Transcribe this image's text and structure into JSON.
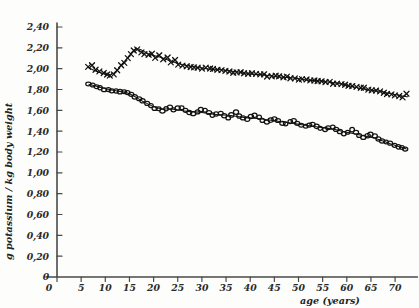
{
  "figure": {
    "background_color": "#fdfdfc",
    "ink_color": "#171717",
    "axis_color": "#4a4a48"
  },
  "axes": {
    "y_title": "g potassium / kg body weight",
    "x_title": "age (years)",
    "y_ticks": [
      "0",
      "0,20",
      "0,40",
      "0,60",
      "0,80",
      "1,00",
      "1,20",
      "1,40",
      "1,60",
      "1,80",
      "2,00",
      "2,20",
      "2,40"
    ],
    "x_ticks": [
      "0",
      "5",
      "10",
      "15",
      "20",
      "25",
      "30",
      "35",
      "40",
      "45",
      "50",
      "55",
      "60",
      "65",
      "70"
    ],
    "x_min": 0,
    "x_max": 74,
    "y_min": 0,
    "y_max": 2.4,
    "grid": false
  },
  "chart_data": {
    "type": "scatter",
    "title": "",
    "subtitle": "",
    "xlabel": "age (years)",
    "ylabel": "g potassium / kg body weight",
    "xlim": [
      0,
      74
    ],
    "ylim": [
      0,
      2.4
    ],
    "xticks": [
      0,
      5,
      10,
      15,
      20,
      25,
      30,
      35,
      40,
      45,
      50,
      55,
      60,
      65,
      70
    ],
    "yticks": [
      0,
      0.2,
      0.4,
      0.6,
      0.8,
      1.0,
      1.2,
      1.4,
      1.6,
      1.8,
      2.0,
      2.2,
      2.4
    ],
    "grid": false,
    "legend": "none",
    "decimal_separator": ",",
    "annotations": [],
    "series": [
      {
        "name": "upper series (x markers)",
        "marker": "x",
        "trend_line": true,
        "points": [
          [
            6.5,
            2.01
          ],
          [
            7.3,
            2.03
          ],
          [
            8.0,
            1.99
          ],
          [
            8.8,
            1.98
          ],
          [
            9.6,
            1.96
          ],
          [
            10.3,
            1.95
          ],
          [
            11.0,
            1.94
          ],
          [
            11.8,
            1.95
          ],
          [
            12.5,
            1.99
          ],
          [
            13.2,
            2.03
          ],
          [
            13.9,
            2.06
          ],
          [
            14.6,
            2.1
          ],
          [
            15.3,
            2.14
          ],
          [
            16.0,
            2.18
          ],
          [
            16.7,
            2.19
          ],
          [
            17.4,
            2.15
          ],
          [
            18.1,
            2.14
          ],
          [
            18.9,
            2.13
          ],
          [
            19.6,
            2.14
          ],
          [
            20.4,
            2.11
          ],
          [
            21.2,
            2.13
          ],
          [
            22.0,
            2.09
          ],
          [
            22.8,
            2.11
          ],
          [
            23.6,
            2.06
          ],
          [
            24.4,
            2.08
          ],
          [
            25.2,
            2.04
          ],
          [
            26.0,
            2.03
          ],
          [
            26.8,
            2.02
          ],
          [
            27.6,
            2.02
          ],
          [
            28.4,
            2.01
          ],
          [
            29.2,
            2.01
          ],
          [
            30.0,
            2.0
          ],
          [
            30.8,
            2.01
          ],
          [
            31.6,
            2.0
          ],
          [
            32.4,
            2.0
          ],
          [
            33.2,
            1.99
          ],
          [
            34.0,
            1.99
          ],
          [
            34.8,
            1.97
          ],
          [
            35.6,
            1.98
          ],
          [
            36.4,
            1.96
          ],
          [
            37.2,
            1.97
          ],
          [
            38.0,
            1.96
          ],
          [
            38.8,
            1.96
          ],
          [
            39.6,
            1.95
          ],
          [
            40.4,
            1.96
          ],
          [
            41.2,
            1.95
          ],
          [
            42.0,
            1.94
          ],
          [
            42.8,
            1.94
          ],
          [
            43.6,
            1.93
          ],
          [
            44.4,
            1.93
          ],
          [
            45.2,
            1.93
          ],
          [
            46.0,
            1.92
          ],
          [
            46.8,
            1.92
          ],
          [
            47.6,
            1.92
          ],
          [
            48.4,
            1.91
          ],
          [
            49.2,
            1.91
          ],
          [
            50.0,
            1.9
          ],
          [
            50.8,
            1.9
          ],
          [
            51.6,
            1.9
          ],
          [
            52.4,
            1.89
          ],
          [
            53.2,
            1.89
          ],
          [
            54.0,
            1.88
          ],
          [
            54.8,
            1.88
          ],
          [
            55.6,
            1.87
          ],
          [
            56.4,
            1.87
          ],
          [
            57.2,
            1.86
          ],
          [
            58.0,
            1.86
          ],
          [
            58.8,
            1.85
          ],
          [
            59.6,
            1.84
          ],
          [
            60.4,
            1.84
          ],
          [
            61.2,
            1.83
          ],
          [
            62.0,
            1.82
          ],
          [
            62.8,
            1.82
          ],
          [
            63.6,
            1.81
          ],
          [
            64.4,
            1.8
          ],
          [
            65.2,
            1.79
          ],
          [
            66.0,
            1.79
          ],
          [
            66.8,
            1.78
          ],
          [
            67.6,
            1.77
          ],
          [
            68.4,
            1.76
          ],
          [
            69.2,
            1.75
          ],
          [
            70.0,
            1.74
          ],
          [
            70.8,
            1.74
          ],
          [
            71.6,
            1.73
          ],
          [
            72.4,
            1.76
          ]
        ],
        "trend": [
          [
            6.5,
            2.01
          ],
          [
            9.0,
            1.96
          ],
          [
            11.5,
            1.95
          ],
          [
            14.0,
            2.07
          ],
          [
            16.5,
            2.19
          ],
          [
            19.0,
            2.14
          ],
          [
            22.0,
            2.1
          ],
          [
            25.0,
            2.05
          ],
          [
            28.0,
            2.02
          ],
          [
            31.0,
            2.0
          ],
          [
            34.0,
            1.99
          ],
          [
            37.0,
            1.97
          ],
          [
            40.0,
            1.95
          ],
          [
            43.0,
            1.94
          ],
          [
            46.0,
            1.92
          ],
          [
            49.0,
            1.91
          ],
          [
            52.0,
            1.89
          ],
          [
            55.0,
            1.88
          ],
          [
            58.0,
            1.86
          ],
          [
            61.0,
            1.83
          ],
          [
            64.0,
            1.8
          ],
          [
            67.0,
            1.78
          ],
          [
            70.0,
            1.75
          ],
          [
            72.6,
            1.73
          ]
        ]
      },
      {
        "name": "lower series (o markers)",
        "marker": "o",
        "trend_line": true,
        "points": [
          [
            6.6,
            1.85
          ],
          [
            7.4,
            1.84
          ],
          [
            8.2,
            1.83
          ],
          [
            9.0,
            1.82
          ],
          [
            9.8,
            1.8
          ],
          [
            10.6,
            1.8
          ],
          [
            11.4,
            1.79
          ],
          [
            12.2,
            1.79
          ],
          [
            13.0,
            1.78
          ],
          [
            13.8,
            1.78
          ],
          [
            14.6,
            1.77
          ],
          [
            15.4,
            1.75
          ],
          [
            16.2,
            1.73
          ],
          [
            17.0,
            1.71
          ],
          [
            17.8,
            1.69
          ],
          [
            18.6,
            1.67
          ],
          [
            19.4,
            1.64
          ],
          [
            20.2,
            1.62
          ],
          [
            21.0,
            1.61
          ],
          [
            21.8,
            1.59
          ],
          [
            22.6,
            1.62
          ],
          [
            23.4,
            1.63
          ],
          [
            24.2,
            1.61
          ],
          [
            25.0,
            1.62
          ],
          [
            25.8,
            1.63
          ],
          [
            26.6,
            1.6
          ],
          [
            27.4,
            1.58
          ],
          [
            28.2,
            1.57
          ],
          [
            29.0,
            1.59
          ],
          [
            29.8,
            1.61
          ],
          [
            30.6,
            1.6
          ],
          [
            31.4,
            1.58
          ],
          [
            32.2,
            1.55
          ],
          [
            33.0,
            1.57
          ],
          [
            33.8,
            1.57
          ],
          [
            34.6,
            1.55
          ],
          [
            35.4,
            1.53
          ],
          [
            36.2,
            1.56
          ],
          [
            37.0,
            1.58
          ],
          [
            37.8,
            1.55
          ],
          [
            38.6,
            1.53
          ],
          [
            39.4,
            1.52
          ],
          [
            40.2,
            1.54
          ],
          [
            41.0,
            1.55
          ],
          [
            41.8,
            1.53
          ],
          [
            42.6,
            1.5
          ],
          [
            43.4,
            1.49
          ],
          [
            44.2,
            1.51
          ],
          [
            45.0,
            1.52
          ],
          [
            45.8,
            1.5
          ],
          [
            46.6,
            1.48
          ],
          [
            47.4,
            1.47
          ],
          [
            48.2,
            1.49
          ],
          [
            49.0,
            1.5
          ],
          [
            49.8,
            1.48
          ],
          [
            50.6,
            1.46
          ],
          [
            51.4,
            1.45
          ],
          [
            52.2,
            1.46
          ],
          [
            53.0,
            1.47
          ],
          [
            53.8,
            1.45
          ],
          [
            54.6,
            1.43
          ],
          [
            55.4,
            1.42
          ],
          [
            56.2,
            1.43
          ],
          [
            57.0,
            1.44
          ],
          [
            57.8,
            1.42
          ],
          [
            58.6,
            1.4
          ],
          [
            59.4,
            1.38
          ],
          [
            60.2,
            1.39
          ],
          [
            61.0,
            1.41
          ],
          [
            61.8,
            1.39
          ],
          [
            62.6,
            1.36
          ],
          [
            63.4,
            1.34
          ],
          [
            64.2,
            1.36
          ],
          [
            65.0,
            1.37
          ],
          [
            65.8,
            1.35
          ],
          [
            66.6,
            1.33
          ],
          [
            67.4,
            1.31
          ],
          [
            68.2,
            1.3
          ],
          [
            69.0,
            1.28
          ],
          [
            69.8,
            1.26
          ],
          [
            70.6,
            1.25
          ],
          [
            71.4,
            1.24
          ],
          [
            72.2,
            1.23
          ]
        ],
        "trend": [
          [
            6.6,
            1.85
          ],
          [
            9.0,
            1.82
          ],
          [
            12.0,
            1.79
          ],
          [
            15.0,
            1.76
          ],
          [
            18.0,
            1.68
          ],
          [
            21.0,
            1.62
          ],
          [
            24.0,
            1.61
          ],
          [
            27.0,
            1.59
          ],
          [
            30.0,
            1.58
          ],
          [
            33.0,
            1.56
          ],
          [
            36.0,
            1.55
          ],
          [
            39.0,
            1.53
          ],
          [
            42.0,
            1.52
          ],
          [
            45.0,
            1.5
          ],
          [
            48.0,
            1.48
          ],
          [
            51.0,
            1.46
          ],
          [
            54.0,
            1.44
          ],
          [
            57.0,
            1.42
          ],
          [
            60.0,
            1.39
          ],
          [
            63.0,
            1.36
          ],
          [
            66.0,
            1.33
          ],
          [
            69.0,
            1.28
          ],
          [
            72.3,
            1.23
          ]
        ]
      }
    ]
  }
}
